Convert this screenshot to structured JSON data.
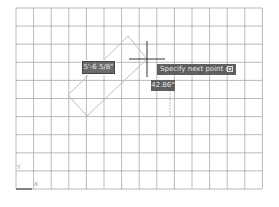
{
  "drawing": {
    "grid": {
      "x0": 16,
      "y0": 8,
      "x1": 262,
      "y1": 189,
      "spacing_x": 17.6,
      "spacing_y": 18.1,
      "line_color": "#a8a8a8"
    },
    "rubber_band_rectangle": {
      "points": [
        [
          128,
          36
        ],
        [
          147,
          59
        ],
        [
          87,
          116
        ],
        [
          68,
          95
        ]
      ],
      "color": "#bdbdbd"
    },
    "crosshair": {
      "x": 147,
      "y": 59,
      "arm": 18,
      "color": "#333333"
    },
    "tracking_line": {
      "x": 170,
      "y1": 90,
      "y2": 116,
      "color": "#bdbdbd"
    }
  },
  "dynamic_input": {
    "length_value": "5'-6 5/8\"",
    "angle_value": "42.86°"
  },
  "command_prompt": {
    "text": "Specify next point or",
    "options_icon": "down-arrow-options-icon"
  },
  "ucs_icon": {
    "y_label": "Y",
    "x_label": "X"
  }
}
